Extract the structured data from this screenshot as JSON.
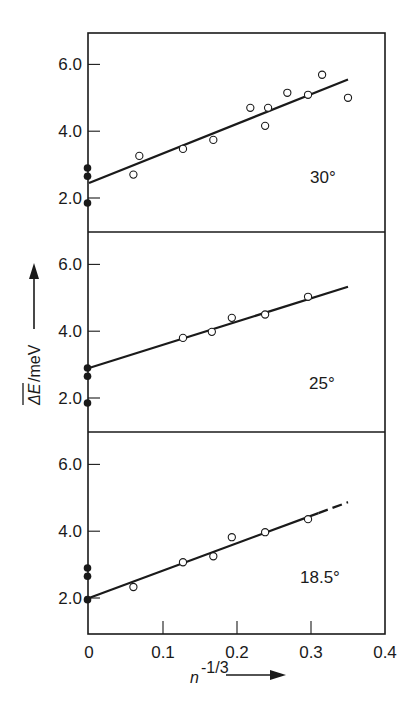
{
  "chart_data": {
    "type": "scatter",
    "layout": "three vertically stacked panels sharing x-axis",
    "xlabel": "n^-1/3",
    "ylabel": "ΔE/meV",
    "ylabel_overline": "ΔE",
    "xlim": [
      0,
      0.4
    ],
    "xticks": [
      0,
      0.1,
      0.2,
      0.3,
      0.4
    ],
    "xtick_labels": [
      "0",
      "0.1",
      "0.2",
      "0.3",
      "0.4"
    ],
    "ylim": [
      1.0,
      7.0
    ],
    "yticks": [
      2.0,
      4.0,
      6.0
    ],
    "ytick_labels": [
      "2.0",
      "4.0",
      "6.0"
    ],
    "grid": false,
    "legend": null,
    "marker_legend": {
      "open_circle": "measured points",
      "filled_circle": "values at n^-1/3 = 0"
    },
    "panels": [
      {
        "label": "30°",
        "open_points": [
          [
            0.06,
            2.7
          ],
          [
            0.068,
            3.26
          ],
          [
            0.127,
            3.47
          ],
          [
            0.168,
            3.74
          ],
          [
            0.218,
            4.7
          ],
          [
            0.238,
            4.16
          ],
          [
            0.242,
            4.7
          ],
          [
            0.268,
            5.15
          ],
          [
            0.296,
            5.09
          ],
          [
            0.315,
            5.69
          ],
          [
            0.35,
            5.0
          ]
        ],
        "filled_points": [
          [
            0,
            2.9
          ],
          [
            0,
            2.65
          ],
          [
            0,
            1.85
          ]
        ],
        "fit_line": [
          [
            0,
            2.45
          ],
          [
            0.35,
            5.55
          ]
        ],
        "fit_dashed_tail": false
      },
      {
        "label": "25°",
        "open_points": [
          [
            0.127,
            3.8
          ],
          [
            0.166,
            3.98
          ],
          [
            0.193,
            4.4
          ],
          [
            0.238,
            4.5
          ],
          [
            0.296,
            5.03
          ]
        ],
        "filled_points": [
          [
            0,
            2.9
          ],
          [
            0,
            2.65
          ],
          [
            0,
            1.85
          ]
        ],
        "fit_line": [
          [
            0,
            2.9
          ],
          [
            0.35,
            5.33
          ]
        ],
        "fit_dashed_tail": false
      },
      {
        "label": "18.5°",
        "open_points": [
          [
            0.06,
            2.33
          ],
          [
            0.127,
            3.07
          ],
          [
            0.168,
            3.25
          ],
          [
            0.193,
            3.82
          ],
          [
            0.238,
            3.97
          ],
          [
            0.296,
            4.36
          ]
        ],
        "filled_points": [
          [
            0,
            2.9
          ],
          [
            0,
            2.65
          ],
          [
            0,
            1.95
          ]
        ],
        "fit_line": [
          [
            0,
            2.0
          ],
          [
            0.35,
            4.87
          ]
        ],
        "fit_dashed_tail": true
      }
    ]
  },
  "labels": {
    "xaxis_main": "n",
    "xaxis_sup": "-1/3",
    "yaxis_delta_e": "ΔE",
    "yaxis_unit": "/meV"
  }
}
